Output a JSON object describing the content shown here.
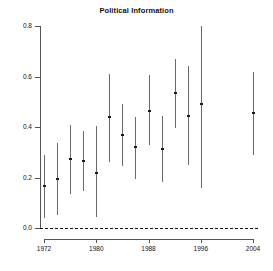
{
  "chart_data": {
    "type": "scatter",
    "title": "Political Information",
    "xlabel": "",
    "ylabel": "",
    "xlim": [
      1971,
      2005
    ],
    "ylim": [
      0.0,
      0.8
    ],
    "grid": false,
    "legend": null,
    "yticks": [
      "0.0",
      "0.2",
      "0.4",
      "0.6",
      "0.8"
    ],
    "ytick_values": [
      0.0,
      0.2,
      0.4,
      0.6,
      0.8
    ],
    "xticks": [
      "1972",
      "1980",
      "1988",
      "1996",
      "2004"
    ],
    "xtick_values": [
      1972,
      1980,
      1988,
      1996,
      2004
    ],
    "reference_line": {
      "y": 0.0,
      "style": "dashed"
    },
    "x": [
      1972,
      1974,
      1976,
      1978,
      1980,
      1982,
      1984,
      1986,
      1988,
      1990,
      1992,
      1994,
      1996,
      1998,
      2000,
      2002,
      2004
    ],
    "estimates": [
      0.165,
      0.195,
      0.275,
      0.265,
      0.22,
      0.44,
      0.37,
      0.32,
      0.45,
      0.465,
      0.315,
      0.535,
      0.445,
      0.49,
      0.455
    ],
    "series": [
      {
        "name": "estimate",
        "points": [
          {
            "year": 1972,
            "value": 0.165,
            "low": 0.04,
            "high": 0.29
          },
          {
            "year": 1974,
            "value": 0.195,
            "low": 0.05,
            "high": 0.335
          },
          {
            "year": 1976,
            "value": 0.275,
            "low": 0.135,
            "high": 0.41
          },
          {
            "year": 1978,
            "value": 0.265,
            "low": 0.145,
            "high": 0.385
          },
          {
            "year": 1980,
            "value": 0.22,
            "low": 0.045,
            "high": 0.405
          },
          {
            "year": 1982,
            "value": 0.44,
            "low": 0.26,
            "high": 0.61
          },
          {
            "year": 1984,
            "value": 0.37,
            "low": 0.245,
            "high": 0.49
          },
          {
            "year": 1986,
            "value": 0.32,
            "low": 0.195,
            "high": 0.44
          },
          {
            "year": 1988,
            "value": 0.465,
            "low": 0.33,
            "high": 0.605
          },
          {
            "year": 1990,
            "value": 0.315,
            "low": 0.18,
            "high": 0.445
          },
          {
            "year": 1992,
            "value": 0.535,
            "low": 0.395,
            "high": 0.67
          },
          {
            "year": 1994,
            "value": 0.445,
            "low": 0.25,
            "high": 0.64
          },
          {
            "year": 1996,
            "value": 0.49,
            "low": 0.16,
            "high": 0.8
          },
          {
            "year": 2004,
            "value": 0.455,
            "low": 0.29,
            "high": 0.62
          }
        ]
      }
    ]
  }
}
